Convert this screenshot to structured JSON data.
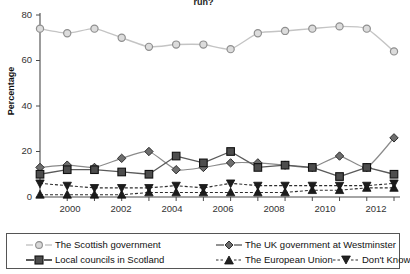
{
  "chart_data": {
    "type": "line",
    "title": "run?",
    "xlabel": "",
    "ylabel": "Percentage",
    "ylim": [
      0,
      80
    ],
    "yticks": [
      0,
      20,
      40,
      60,
      80
    ],
    "xlim": [
      1999,
      2012
    ],
    "xticks": [
      2000,
      2002,
      2004,
      2006,
      2008,
      2010,
      2012
    ],
    "xtick_labels": [
      "2000",
      "2002",
      "2004",
      "2006",
      "2008",
      "2010",
      "2012"
    ],
    "grid": false,
    "legend_position": "bottom",
    "x": [
      1999,
      2000,
      2001,
      2002,
      2003,
      2004,
      2005,
      2006,
      2007,
      2008,
      2009,
      2010,
      2011,
      2012
    ],
    "series": [
      {
        "name": "The Scottish government",
        "marker": "circle-open",
        "values": [
          74,
          72,
          74,
          70,
          66,
          67,
          67,
          65,
          72,
          73,
          74,
          75,
          74,
          64
        ]
      },
      {
        "name": "The UK government at Westminster",
        "marker": "diamond",
        "values": [
          13,
          14,
          13,
          17,
          20,
          12,
          13,
          15,
          15,
          14,
          13,
          18,
          13,
          26
        ]
      },
      {
        "name": "Local councils in Scotland",
        "marker": "square",
        "values": [
          10,
          12,
          12,
          11,
          10,
          18,
          15,
          20,
          13,
          14,
          13,
          9,
          13,
          10
        ]
      },
      {
        "name": "The European Union",
        "marker": "triangle-up",
        "values": [
          1,
          1,
          1,
          1,
          2,
          2,
          2,
          2,
          2,
          2,
          3,
          3,
          4,
          4
        ]
      },
      {
        "name": "Don't Know",
        "marker": "triangle-down",
        "values": [
          6,
          5,
          4,
          4,
          4,
          5,
          4,
          6,
          5,
          5,
          5,
          5,
          5,
          6
        ]
      }
    ]
  },
  "legend": {
    "items": [
      {
        "label": "The Scottish government",
        "marker": "circle-open"
      },
      {
        "label": "The UK government at Westminster",
        "marker": "diamond"
      },
      {
        "label": "Local councils in Scotland",
        "marker": "square"
      },
      {
        "label": "The European Union",
        "marker": "triangle-up"
      },
      {
        "label": "Don't Know",
        "marker": "triangle-down"
      }
    ]
  },
  "axis": {
    "y_title": "Percentage",
    "y_labels": [
      "80",
      "60",
      "40",
      "20",
      "0"
    ],
    "x_labels": [
      "2000",
      "2002",
      "2004",
      "2006",
      "2008",
      "2010",
      "2012"
    ]
  },
  "colors": {
    "light_series": "#b9b9b9",
    "dark_series": "#3a3a3a",
    "axis": "#4a4a4a",
    "text": "#1a1a1a"
  }
}
